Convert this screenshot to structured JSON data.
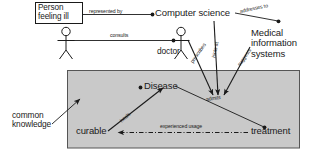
{
  "diagram": {
    "background": "#ffffff",
    "stroke": "#1a1a1a",
    "panel_fill": "#c9c9c9",
    "panel_border": "#555555",
    "nodes": {
      "person_feeling_ill": "Person\nfeeling ill",
      "computer_science": "Computer science",
      "medical_information_systems": "Medical\ninformation\nsystems",
      "doctor": "doctor",
      "disease": "Disease",
      "curable": "curable",
      "treatment": "treatment",
      "common_knowledge": "common\nknowledge"
    },
    "edges": {
      "represented_by": "represented by",
      "addresses_to": "addresses to",
      "consults": "consults",
      "prescribes": "prescribes",
      "hints_at": "hints at",
      "suggests": "suggests",
      "admits": "admits",
      "heals": "heals",
      "experienced_usage": "experienced usage"
    }
  }
}
